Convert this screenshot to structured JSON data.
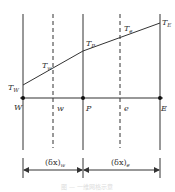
{
  "diagram": {
    "type": "1D finite volume grid",
    "nodes": [
      {
        "id": "W",
        "label": "W",
        "temp_label": "T",
        "temp_sub": "W"
      },
      {
        "id": "P",
        "label": "P",
        "temp_label": "T",
        "temp_sub": "P"
      },
      {
        "id": "E",
        "label": "E",
        "temp_label": "T",
        "temp_sub": "E"
      }
    ],
    "faces": [
      {
        "id": "w",
        "label": "w",
        "temp_label": "T",
        "temp_sub": "w"
      },
      {
        "id": "e",
        "label": "e",
        "temp_label": "T",
        "temp_sub": "e"
      }
    ],
    "distances": [
      {
        "label": "(δx)",
        "sub": "w"
      },
      {
        "label": "(δx)",
        "sub": "e"
      }
    ],
    "caption": "图 — 一维网格示意"
  }
}
